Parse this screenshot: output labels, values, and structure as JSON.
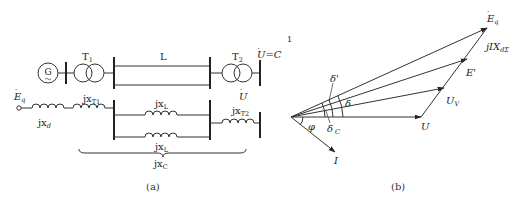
{
  "figure": {
    "panel_a": {
      "caption": "(a)",
      "single_line": {
        "generator": "G",
        "transformer1": "T",
        "transformer1_sub": "1",
        "line": "L",
        "transformer2": "T",
        "transformer2_sub": "2",
        "bus_voltage": "U=C",
        "footnote_marker": "1"
      },
      "equivalent": {
        "source": "E",
        "source_sub": "q",
        "xd": "jx",
        "xd_sub": "d",
        "xT1": "jx",
        "xT1_sub": "T1",
        "xL_top": "jx",
        "xL_top_sub": "L",
        "xL_bottom": "jx",
        "xL_bottom_sub": "L",
        "xT2": "jx",
        "xT2_sub": "T2",
        "bus_voltage": "U",
        "xC": "jx",
        "xC_sub": "C"
      }
    },
    "panel_b": {
      "caption": "(b)",
      "phasors": {
        "Eq": "E",
        "Eq_sub": "q",
        "E_prime": "E'",
        "Uv": "U",
        "Uv_sub": "V",
        "U": "U",
        "I": "I",
        "drop": "jIX",
        "drop_sub": "dΣ"
      },
      "angles": {
        "delta": "δ",
        "delta_prime": "δ'",
        "delta_c": "δ",
        "delta_c_sub": "C",
        "phi": "φ"
      }
    }
  }
}
